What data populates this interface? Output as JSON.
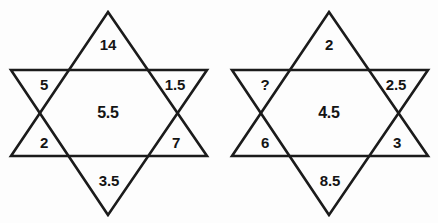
{
  "figure": {
    "background_color": "#fdfdfd",
    "line_color": "#1b1b1b",
    "text_color": "#141414"
  },
  "stars": [
    {
      "name": "left-star",
      "center": "5.5",
      "points": {
        "top": "14",
        "upper_left": "5",
        "upper_right": "1.5",
        "lower_left": "2",
        "lower_right": "7",
        "bottom": "3.5"
      }
    },
    {
      "name": "right-star",
      "center": "4.5",
      "points": {
        "top": "2",
        "upper_left": "?",
        "upper_right": "2.5",
        "lower_left": "6",
        "lower_right": "3",
        "bottom": "8.5"
      }
    }
  ]
}
